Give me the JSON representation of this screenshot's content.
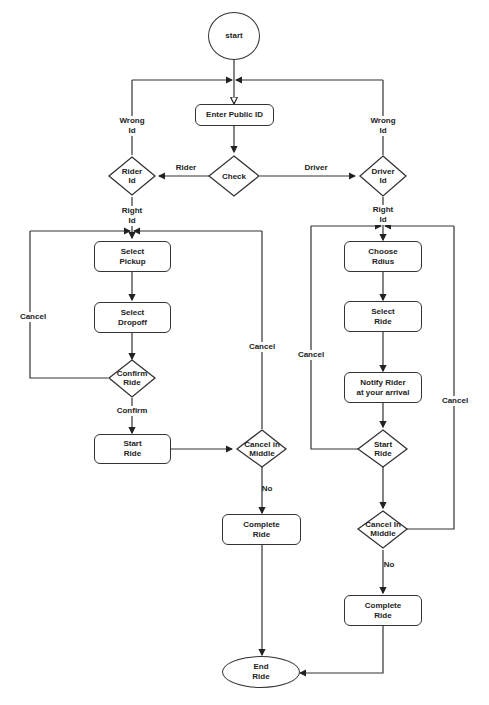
{
  "diagram": {
    "type": "flowchart",
    "nodes": {
      "start": "start",
      "enter_public_id": "Enter Public ID",
      "check": "Check",
      "rider_id": "Rider\nId",
      "driver_id": "Driver\nId",
      "select_pickup": "Select\nPickup",
      "select_dropoff": "Select\nDropoff",
      "confirm_ride": "Confirm\nRide",
      "start_ride_rider": "Start\nRide",
      "cancel_in_middle_rider": "Cancel in\nMiddle",
      "complete_ride_rider": "Complete\nRide",
      "choose_radius": "Choose\nRdius",
      "select_ride": "Select\nRide",
      "notify_rider": "Notify Rider\nat your arrival",
      "start_ride_driver": "Start\nRide",
      "cancel_in_middle_driver": "Cancel In\nMiddle",
      "complete_ride_driver": "Complete\nRide",
      "end_ride": "End\nRide"
    },
    "edge_labels": {
      "wrong_id_left": "Wrong\nId",
      "wrong_id_right": "Wrong\nId",
      "rider": "Rider",
      "driver": "Driver",
      "right_id_left": "Right\nId",
      "right_id_right": "Right\nId",
      "cancel_left_loop": "Cancel",
      "cancel_rider_middle": "Cancel",
      "confirm": "Confirm",
      "no_rider": "No",
      "cancel_driver_left": "Cancel",
      "cancel_driver_right": "Cancel",
      "no_driver": "No"
    }
  }
}
